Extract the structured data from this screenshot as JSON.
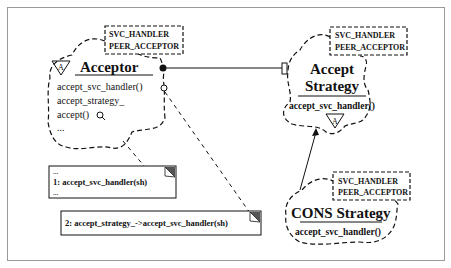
{
  "acceptor": {
    "template_params": [
      "SVC_HANDLER",
      "PEER_ACCEPTOR"
    ],
    "name": "Acceptor",
    "abstract_marker": "A",
    "members": [
      "accept_svc_handler()",
      "accept_strategy_",
      "accept()",
      "..."
    ]
  },
  "accept_strategy": {
    "template_params": [
      "SVC_HANDLER",
      "PEER_ACCEPTOR"
    ],
    "name_line1": "Accept",
    "name_line2": "Strategy",
    "members": [
      "accept_svc_handler()"
    ],
    "abstract_marker": "A"
  },
  "cons_strategy": {
    "template_params": [
      "SVC_HANDLER",
      "PEER_ACCEPTOR"
    ],
    "name": "CONS Strategy",
    "members": [
      "accept_svc_handler()"
    ]
  },
  "notes": {
    "note1": {
      "lines": [
        "...",
        "1: accept_svc_handler(sh)",
        "..."
      ]
    },
    "note2": {
      "lines": [
        "2: accept_strategy_->accept_svc_handler(sh)"
      ]
    }
  },
  "colors": {
    "line": "#111111",
    "frame": "#9a9a9a",
    "note_corner": "#555555"
  }
}
